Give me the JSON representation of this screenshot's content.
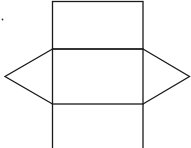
{
  "diagram": {
    "title": "",
    "faces": [
      {
        "name": "top-rectangle",
        "shape": "rectangle"
      },
      {
        "name": "middle-rectangle",
        "shape": "rectangle"
      },
      {
        "name": "bottom-rectangle",
        "shape": "rectangle"
      },
      {
        "name": "left-triangle",
        "shape": "triangle"
      },
      {
        "name": "right-triangle",
        "shape": "triangle"
      }
    ],
    "marker": "dot",
    "line_color": "#1a1a1a"
  }
}
